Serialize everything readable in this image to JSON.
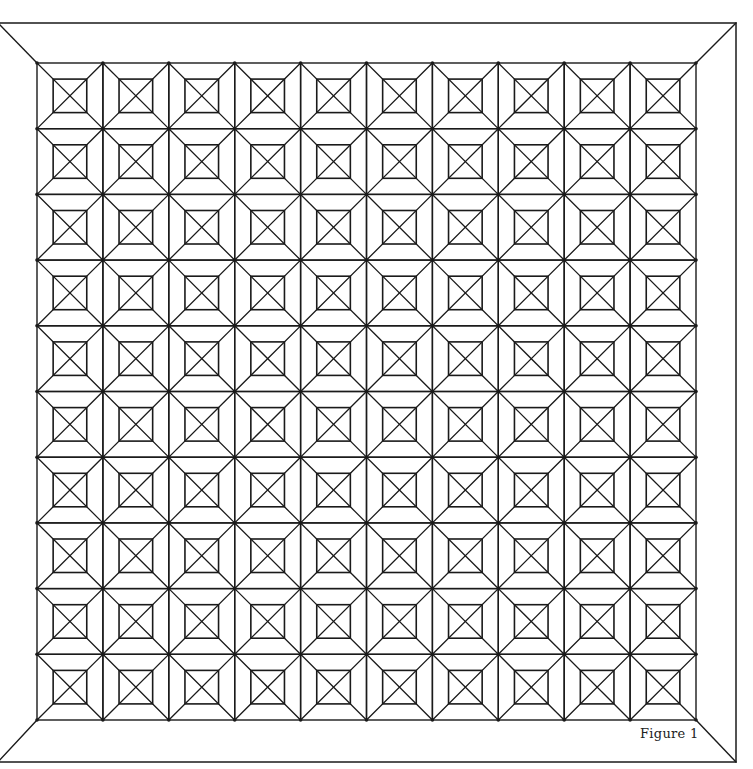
{
  "figure": {
    "caption": "Figure 1",
    "stroke_color": "#1a1a1a",
    "background": "#ffffff",
    "outer_frame": {
      "x1": -2,
      "y1": 23,
      "x2": 736,
      "y2": 762
    },
    "inner_grid": {
      "x": 37,
      "y": 63,
      "width": 659,
      "height": 657,
      "columns": 10,
      "rows": 10
    },
    "cell_pattern": {
      "description": "square cell with full corner-to-corner diagonals, a centered inset square, and an X inside the inset square",
      "inset_ratio": 0.245
    }
  }
}
